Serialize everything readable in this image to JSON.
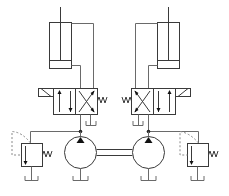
{
  "diagram": {
    "type": "hydraulic-schematic",
    "colors": {
      "line": "#3a3a3a",
      "pilot_line": "#8a8a8a",
      "background": "#ffffff"
    },
    "components": [
      {
        "id": "cylinder-left",
        "kind": "double-acting cylinder"
      },
      {
        "id": "cylinder-right",
        "kind": "double-acting cylinder"
      },
      {
        "id": "valve-left",
        "kind": "4/2 directional valve, solenoid + spring return"
      },
      {
        "id": "valve-right",
        "kind": "4/2 directional valve, solenoid + spring return"
      },
      {
        "id": "pump-left",
        "kind": "fixed displacement pump"
      },
      {
        "id": "pump-right",
        "kind": "fixed displacement pump"
      },
      {
        "id": "shaft",
        "kind": "common drive shaft"
      },
      {
        "id": "relief-left",
        "kind": "pressure relief valve"
      },
      {
        "id": "relief-right",
        "kind": "pressure relief valve"
      },
      {
        "id": "tanks",
        "kind": "reservoir symbols",
        "count": 6
      }
    ]
  }
}
